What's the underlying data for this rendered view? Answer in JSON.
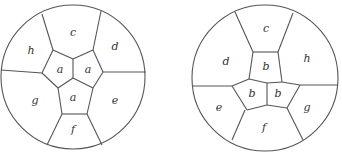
{
  "figures": [
    {
      "id": "left",
      "circle": {
        "cx": 73,
        "cy": 77,
        "r": 72
      },
      "segments": [
        [
          42,
          14,
          53,
          50
        ],
        [
          101,
          11,
          93,
          50
        ],
        [
          146,
          72,
          103,
          72
        ],
        [
          1,
          70,
          42,
          73
        ],
        [
          47,
          145,
          62,
          114
        ],
        [
          102,
          145,
          87,
          114
        ],
        [
          53,
          50,
          73,
          59
        ],
        [
          73,
          59,
          93,
          50
        ],
        [
          93,
          50,
          103,
          72
        ],
        [
          103,
          72,
          93,
          88
        ],
        [
          93,
          88,
          87,
          114
        ],
        [
          87,
          114,
          62,
          114
        ],
        [
          62,
          114,
          58,
          88
        ],
        [
          58,
          88,
          42,
          73
        ],
        [
          42,
          73,
          53,
          50
        ],
        [
          73,
          59,
          73,
          78
        ],
        [
          73,
          78,
          58,
          88
        ],
        [
          73,
          78,
          93,
          88
        ]
      ],
      "labels": [
        {
          "text": "c",
          "x": 73,
          "y": 33
        },
        {
          "text": "d",
          "x": 115,
          "y": 47
        },
        {
          "text": "h",
          "x": 31,
          "y": 51
        },
        {
          "text": "a",
          "x": 60,
          "y": 70
        },
        {
          "text": "a",
          "x": 88,
          "y": 70
        },
        {
          "text": "a",
          "x": 73,
          "y": 98
        },
        {
          "text": "g",
          "x": 35,
          "y": 101
        },
        {
          "text": "e",
          "x": 115,
          "y": 101
        },
        {
          "text": "f",
          "x": 73,
          "y": 130
        }
      ]
    },
    {
      "id": "right",
      "circle": {
        "cx": 265,
        "cy": 78,
        "r": 73
      },
      "segments": [
        [
          235,
          12,
          253,
          52
        ],
        [
          293,
          13,
          278,
          52
        ],
        [
          192,
          86,
          232,
          86
        ],
        [
          338,
          85,
          300,
          85
        ],
        [
          232,
          140,
          245,
          110
        ],
        [
          303,
          140,
          287,
          108
        ],
        [
          253,
          52,
          278,
          52
        ],
        [
          278,
          52,
          282,
          82
        ],
        [
          253,
          52,
          249,
          79
        ],
        [
          249,
          79,
          232,
          86
        ],
        [
          232,
          86,
          247,
          110
        ],
        [
          247,
          110,
          267,
          105
        ],
        [
          267,
          105,
          287,
          108
        ],
        [
          287,
          108,
          300,
          85
        ],
        [
          300,
          85,
          282,
          82
        ],
        [
          282,
          82,
          267,
          83
        ],
        [
          267,
          83,
          249,
          79
        ],
        [
          267,
          83,
          267,
          105
        ]
      ],
      "labels": [
        {
          "text": "c",
          "x": 266,
          "y": 29
        },
        {
          "text": "d",
          "x": 226,
          "y": 62
        },
        {
          "text": "h",
          "x": 307,
          "y": 59
        },
        {
          "text": "b",
          "x": 266,
          "y": 67
        },
        {
          "text": "b",
          "x": 252,
          "y": 94
        },
        {
          "text": "b",
          "x": 278,
          "y": 94
        },
        {
          "text": "e",
          "x": 219,
          "y": 108
        },
        {
          "text": "g",
          "x": 307,
          "y": 108
        },
        {
          "text": "f",
          "x": 264,
          "y": 128
        }
      ]
    }
  ]
}
